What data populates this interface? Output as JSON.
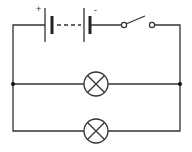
{
  "diagram": {
    "type": "electric circuit",
    "battery": {
      "positive_label": "+",
      "negative_label": "-",
      "cells": 2
    },
    "switch": {
      "state": "open"
    },
    "lamps": [
      {
        "id": "lamp-1",
        "branch": "upper"
      },
      {
        "id": "lamp-2",
        "branch": "lower"
      }
    ],
    "junctions": 2,
    "colors": {
      "wire": "#333333",
      "background": "#ffffff"
    }
  }
}
